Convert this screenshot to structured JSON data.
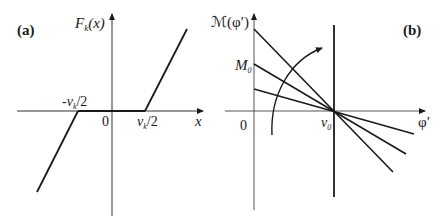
{
  "panel_a": {
    "tag": "(a)",
    "y_axis_label": "F",
    "y_axis_label_sub": "k",
    "y_axis_label_arg": "(x)",
    "x_axis_label": "x",
    "origin_label": "0",
    "neg_threshold_label": "-v",
    "neg_threshold_sub": "k",
    "neg_threshold_tail": "/2",
    "pos_threshold_label": "v",
    "pos_threshold_sub": "k",
    "pos_threshold_tail": "/2"
  },
  "panel_b": {
    "tag": "(b)",
    "y_axis_label": "ℳ(φ′)",
    "x_axis_label": "φ′",
    "origin_label": "0",
    "intercept_label": "M",
    "intercept_sub": "0",
    "pivot_label": "ν",
    "pivot_sub": "0"
  },
  "colors": {
    "ink": "#1a1a1a",
    "background": "#ffffff"
  }
}
